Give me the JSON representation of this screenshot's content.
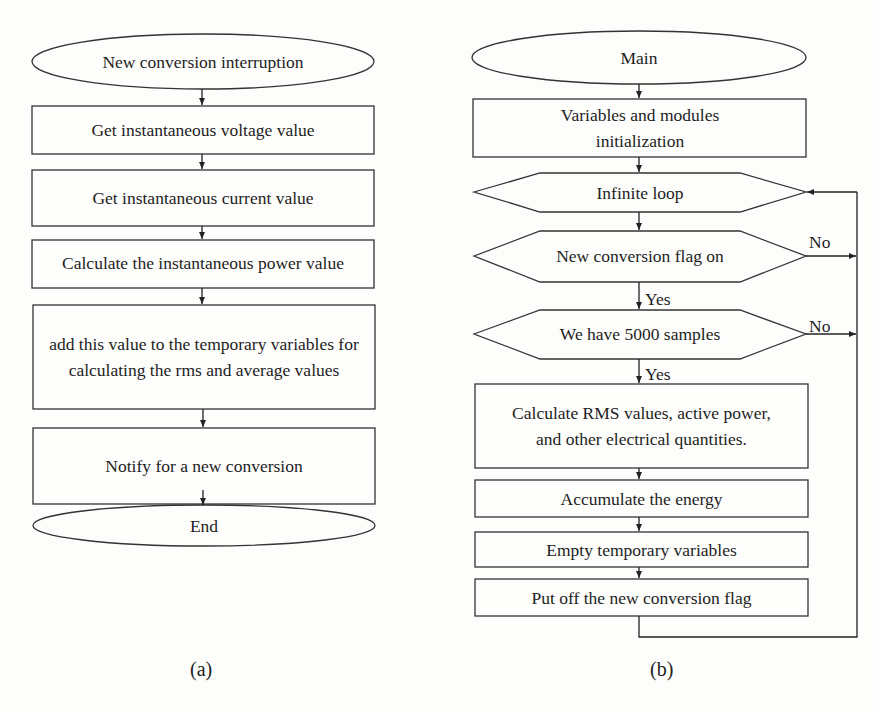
{
  "figure_a": {
    "caption": "(a)",
    "nodes": [
      {
        "type": "terminal",
        "label": "New conversion interruption"
      },
      {
        "type": "process",
        "label": "Get instantaneous voltage value"
      },
      {
        "type": "process",
        "label": "Get instantaneous current value"
      },
      {
        "type": "process",
        "label": "Calculate the instantaneous power value"
      },
      {
        "type": "process",
        "label": "add this value to the temporary variables for calculating the rms and average values"
      },
      {
        "type": "process",
        "label": "Notify for a new conversion"
      },
      {
        "type": "terminal",
        "label": "End"
      }
    ]
  },
  "figure_b": {
    "caption": "(b)",
    "nodes": [
      {
        "type": "terminal",
        "label": "Main"
      },
      {
        "type": "process",
        "label": "Variables  and modules initialization"
      },
      {
        "type": "loop",
        "label": "Infinite loop"
      },
      {
        "type": "decision",
        "label": "New conversion flag on"
      },
      {
        "type": "decision",
        "label": "We have 5000 samples"
      },
      {
        "type": "process",
        "label": "Calculate RMS values, active power, and other electrical quantities."
      },
      {
        "type": "process",
        "label": "Accumulate the energy"
      },
      {
        "type": "process",
        "label": "Empty temporary variables"
      },
      {
        "type": "process",
        "label": "Put off the new conversion flag"
      }
    ],
    "edge_labels": {
      "yes1": "Yes",
      "yes2": "Yes",
      "no1": "No",
      "no2": "No"
    }
  }
}
